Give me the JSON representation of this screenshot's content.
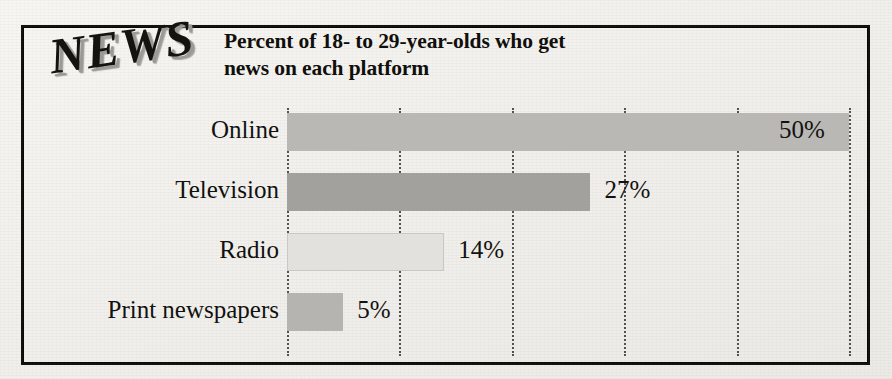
{
  "figure": {
    "logo_text": "NEWS",
    "frame_color": "#14120f",
    "background_color": "#f3f2ef"
  },
  "chart_data": {
    "type": "bar",
    "orientation": "horizontal",
    "title": "Percent of 18- to 29-year-olds who get news on each platform",
    "title_line1": "Percent of 18- to 29-year-olds who get",
    "title_line2": "news on each platform",
    "xlabel": "",
    "ylabel": "",
    "xlim": [
      0,
      50
    ],
    "grid": true,
    "grid_axis": "x",
    "grid_style": "dotted",
    "gridline_values": [
      0,
      10,
      20,
      30,
      40,
      50
    ],
    "legend": false,
    "categories": [
      "Online",
      "Television",
      "Radio",
      "Print newspapers"
    ],
    "values": [
      50,
      27,
      14,
      5
    ],
    "value_labels": [
      "50%",
      "27%",
      "14%",
      "5%"
    ],
    "value_label_position": [
      "inside-end",
      "outside-end",
      "outside-end",
      "outside-end"
    ],
    "bar_colors": [
      "#b9b8b5",
      "#a2a19d",
      "#e2e1dd",
      "#b5b4b0"
    ],
    "bars": [
      {
        "category": "Online",
        "value": 50,
        "label": "50%",
        "color": "#b9b8b5"
      },
      {
        "category": "Television",
        "value": 27,
        "label": "27%",
        "color": "#a2a19d"
      },
      {
        "category": "Radio",
        "value": 14,
        "label": "14%",
        "color": "#e2e1dd"
      },
      {
        "category": "Print newspapers",
        "value": 5,
        "label": "5%",
        "color": "#b5b4b0"
      }
    ]
  }
}
